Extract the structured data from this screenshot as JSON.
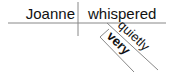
{
  "diagram": {
    "type": "reed-kellogg-sentence-diagram",
    "subject": "Joanne",
    "verb": "whispered",
    "modifiers": [
      {
        "word": "quietly",
        "modifies": "whispered",
        "role": "adverb"
      },
      {
        "word": "very",
        "modifies": "quietly",
        "role": "adverb"
      }
    ],
    "colors": {
      "line": "#888888",
      "text": "#111111"
    }
  }
}
